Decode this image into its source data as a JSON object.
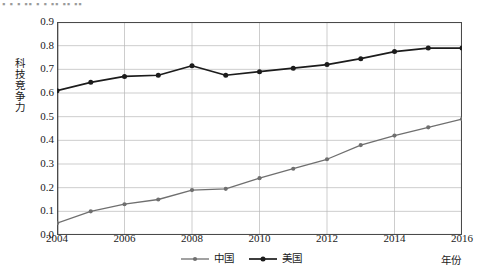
{
  "top_cut_text": "▪ ▪ ▪ ▪▪ ▪ ▪ ▪▪ ▪▪ ▪▪",
  "axes": {
    "ylabel": "科技竞争力",
    "xlabel": "年份",
    "yticks": [
      "0.9",
      "0.8",
      "0.7",
      "0.6",
      "0.5",
      "0.4",
      "0.3",
      "0.2",
      "0.1",
      "0.0"
    ],
    "xticks": [
      "2004",
      "2006",
      "2008",
      "2010",
      "2012",
      "2014",
      "2016"
    ]
  },
  "colors": {
    "china_line": "#6f6f6f",
    "usa_line": "#1c1c1c",
    "grid": "#b8b8b8",
    "axis": "#4a4a4a",
    "background": "#ffffff"
  },
  "legend": {
    "items": [
      {
        "label": "中国",
        "color": "#6f6f6f"
      },
      {
        "label": "美国",
        "color": "#1c1c1c"
      }
    ]
  },
  "chart_data": {
    "type": "line",
    "title": "",
    "xlabel": "年份",
    "ylabel": "科技竞争力",
    "xlim": [
      2004,
      2016
    ],
    "ylim": [
      0.0,
      0.9
    ],
    "grid": true,
    "legend_position": "bottom-center",
    "x": [
      2004,
      2005,
      2006,
      2007,
      2008,
      2009,
      2010,
      2011,
      2012,
      2013,
      2014,
      2015,
      2016
    ],
    "series": [
      {
        "name": "中国",
        "color": "#6f6f6f",
        "marker": "circle",
        "values": [
          0.05,
          0.1,
          0.13,
          0.15,
          0.19,
          0.195,
          0.24,
          0.28,
          0.32,
          0.38,
          0.42,
          0.455,
          0.49
        ]
      },
      {
        "name": "美国",
        "color": "#1c1c1c",
        "marker": "circle",
        "values": [
          0.61,
          0.645,
          0.67,
          0.675,
          0.715,
          0.675,
          0.69,
          0.705,
          0.72,
          0.745,
          0.775,
          0.79,
          0.79
        ]
      }
    ]
  }
}
